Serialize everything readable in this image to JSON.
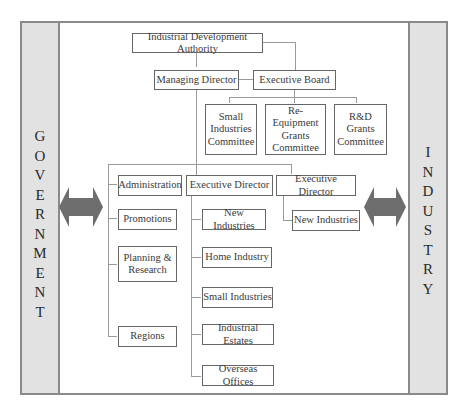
{
  "side_panels": {
    "left": {
      "label": "GOVERNMENT",
      "letters": [
        "G",
        "O",
        "V",
        "E",
        "R",
        "N",
        "M",
        "E",
        "N",
        "T"
      ]
    },
    "right": {
      "label": "INDUSTRY",
      "letters": [
        "I",
        "N",
        "D",
        "U",
        "S",
        "T",
        "R",
        "Y"
      ]
    }
  },
  "arrows": {
    "left": "double-headed-arrow",
    "right": "double-headed-arrow",
    "color": "#6e6e6e"
  },
  "org_chart": {
    "top": {
      "label": "Industrial Development Authority"
    },
    "managing_director": {
      "label": "Managing Director"
    },
    "executive_board": {
      "label": "Executive Board"
    },
    "committees": [
      {
        "label": "Small\nIndustries\nCommittee"
      },
      {
        "label": "Re-Equipment\nGrants\nCommittee"
      },
      {
        "label": "R&D\nGrants\nCommittee"
      }
    ],
    "staff_units": [
      {
        "label": "Administration"
      },
      {
        "label": "Promotions"
      },
      {
        "label": "Planning &\nResearch"
      },
      {
        "label": "Regions"
      }
    ],
    "executive_director_1": {
      "label": "Executive Director",
      "divisions": [
        {
          "label": "New Industries"
        },
        {
          "label": "Home Industry"
        },
        {
          "label": "Small Industries"
        },
        {
          "label": "Industrial Estates"
        },
        {
          "label": "Overseas Offices"
        }
      ]
    },
    "executive_director_2": {
      "label": "Executive Director",
      "divisions": [
        {
          "label": "New Industries"
        }
      ]
    }
  },
  "colors": {
    "panel_fill": "#e2e2e2",
    "border": "#8a8a8a",
    "box_border": "#666666",
    "connector": "#9a9a9a",
    "arrow": "#6e6e6e"
  }
}
